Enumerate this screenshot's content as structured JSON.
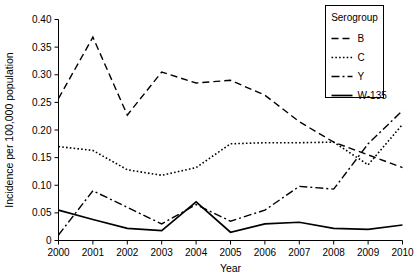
{
  "chart_data": {
    "type": "line",
    "title": "",
    "xlabel": "Year",
    "ylabel": "Incidence per 100,000 population",
    "x": [
      2000,
      2001,
      2002,
      2003,
      2004,
      2005,
      2006,
      2007,
      2008,
      2009,
      2010
    ],
    "xtick_labels": [
      "2000",
      "2001",
      "2002",
      "2003",
      "2004",
      "2005",
      "2006",
      "2007",
      "2008",
      "2009",
      "2010"
    ],
    "ytick_labels": [
      "0",
      "0.05",
      "0.10",
      "0.15",
      "0.20",
      "0.25",
      "0.30",
      "0.35",
      "0.40"
    ],
    "ytick_values": [
      0,
      0.05,
      0.1,
      0.15,
      0.2,
      0.25,
      0.3,
      0.35,
      0.4
    ],
    "ylim": [
      0,
      0.4
    ],
    "xlim": [
      2000,
      2010
    ],
    "grid": false,
    "legend_position": "top-right",
    "legend_title": "Serogroup",
    "series": [
      {
        "name": "B",
        "dash": "7,4",
        "width": 1.4,
        "values": [
          0.257,
          0.368,
          0.227,
          0.305,
          0.285,
          0.29,
          0.263,
          0.215,
          0.178,
          0.155,
          0.132
        ]
      },
      {
        "name": "C",
        "dash": "1.6,2.2",
        "width": 1.6,
        "values": [
          0.17,
          0.163,
          0.128,
          0.118,
          0.132,
          0.175,
          0.177,
          0.177,
          0.178,
          0.137,
          0.21
        ]
      },
      {
        "name": "Y",
        "dash": "8,3,2,3",
        "width": 1.4,
        "values": [
          0.01,
          0.09,
          0.06,
          0.03,
          0.065,
          0.035,
          0.055,
          0.098,
          0.093,
          0.175,
          0.235
        ]
      },
      {
        "name": "W-135",
        "dash": "none",
        "width": 1.7,
        "values": [
          0.055,
          0.038,
          0.022,
          0.018,
          0.07,
          0.015,
          0.03,
          0.033,
          0.022,
          0.02,
          0.028
        ]
      }
    ]
  },
  "legend": {
    "title": "Serogroup",
    "entries": [
      {
        "label": "B",
        "dash": "7,4",
        "width": 1.4
      },
      {
        "label": "C",
        "dash": "1.6,2.2",
        "width": 1.6
      },
      {
        "label": "Y",
        "dash": "8,3,2,3",
        "width": 1.4
      },
      {
        "label": "W-135",
        "dash": "none",
        "width": 1.7
      }
    ]
  },
  "colors": {
    "ink": "#000000",
    "background": "#ffffff"
  }
}
